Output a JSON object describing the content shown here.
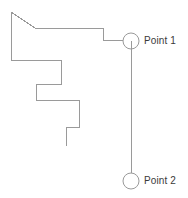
{
  "diagram": {
    "background_color": "#ffffff",
    "stroke_color": "#9a9a9a",
    "stroke_width": 1,
    "text_color": "#3a3a3a",
    "canvas": {
      "width": 188,
      "height": 198
    },
    "labels": {
      "point_1": "Point 1",
      "point_2": "Point 2"
    },
    "markers": [
      {
        "id": "point-1",
        "name": "point-1-marker",
        "label": "Point 1",
        "center": {
          "x": 131,
          "y": 41
        },
        "radius": 8,
        "shape": "circle",
        "has_center_stub": true
      },
      {
        "id": "point-2",
        "name": "point-2-marker",
        "label": "Point 2",
        "center": {
          "x": 131,
          "y": 181
        },
        "radius": 8,
        "shape": "circle",
        "has_center_stub": false
      }
    ],
    "connector": {
      "name": "point-1-to-point-2-connector",
      "from": {
        "x": 131,
        "y": 49
      },
      "to": {
        "x": 131,
        "y": 173
      },
      "orientation": "vertical"
    },
    "outline_polyline": {
      "name": "boundary-outline",
      "points": "11,12 35,28 103,28 103,40 123,40"
    },
    "staircase_polyline": {
      "name": "staircase-outline",
      "points": "11,12 11,60 61,60 61,84 36,84 36,100 79,100 79,127 66,127 66,146"
    }
  }
}
